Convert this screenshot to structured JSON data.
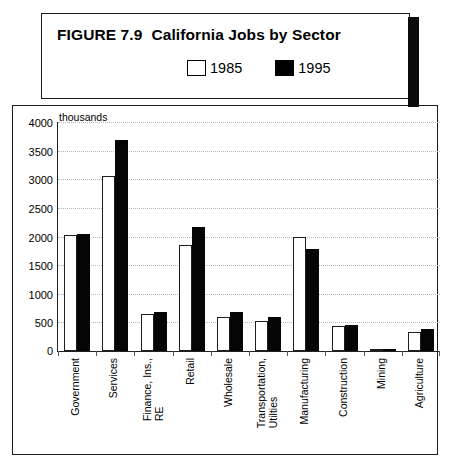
{
  "title": {
    "figure_number": "FIGURE 7.9",
    "caption": "California Jobs by Sector"
  },
  "legend": {
    "items": [
      {
        "label": "1985",
        "swatch": "white-square-icon",
        "color": "#ffffff"
      },
      {
        "label": "1995",
        "swatch": "black-square-icon",
        "color": "#000000"
      }
    ]
  },
  "axis": {
    "units_label": "thousands",
    "y_ticks": [
      "4000",
      "3500",
      "3000",
      "2500",
      "2000",
      "1500",
      "1000",
      "500",
      "0"
    ]
  },
  "chart_data": {
    "type": "bar",
    "xlabel": "",
    "ylabel": "thousands",
    "ylim": [
      0,
      4000
    ],
    "ytick_step": 500,
    "grid": true,
    "legend_position": "above-plot",
    "categories": [
      "Government",
      "Services",
      "Finance, Ins.,\nRE",
      "Retail",
      "Wholesale",
      "Transportation,\nUtilties",
      "Manufacturing",
      "Construction",
      "Mining",
      "Agriculture"
    ],
    "series": [
      {
        "name": "1985",
        "color": "#ffffff",
        "values": [
          2030,
          3060,
          650,
          1850,
          600,
          520,
          2000,
          430,
          35,
          330
        ]
      },
      {
        "name": "1995",
        "color": "#000000",
        "values": [
          2050,
          3680,
          680,
          2170,
          680,
          590,
          1780,
          460,
          25,
          380
        ]
      }
    ]
  }
}
